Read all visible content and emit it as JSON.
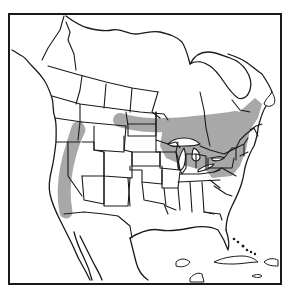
{
  "map": {
    "title": "",
    "region": "North America (Canada, United States, Mexico, Caribbean)",
    "projection": "outline map with state and province borders",
    "colors": {
      "background": "#ffffff",
      "line": "#1a1a1a",
      "range_fill": "#a8a8a8"
    },
    "layers": [
      {
        "name": "frame",
        "type": "rectangle"
      },
      {
        "name": "coastline",
        "type": "line"
      },
      {
        "name": "political-borders",
        "type": "line"
      },
      {
        "name": "great-lakes",
        "type": "polygon"
      },
      {
        "name": "distribution-range",
        "type": "shaded-area",
        "color": "#a8a8a8"
      }
    ],
    "range_regions": [
      "Pacific Northwest / Cascades – Sierra Nevada band",
      "Northern Rockies (Idaho / Montana)",
      "Southern Canada band from Alberta/Saskatchewan east to Quebec",
      "Great Lakes region (Minnesota, Wisconsin, Michigan)",
      "New England and Maritime provinces",
      "New York and Pennsylvania"
    ]
  }
}
